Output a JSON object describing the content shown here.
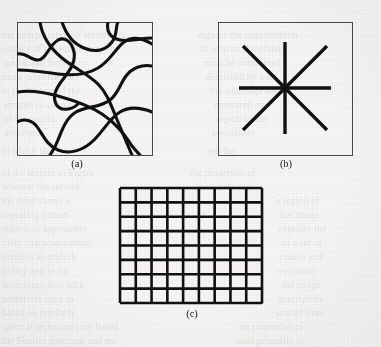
{
  "figure": {
    "background_color": "#f5f4f2",
    "ink_color": "#111111",
    "frame_color": "#4a4a4a",
    "panels": [
      {
        "id": "a",
        "caption": "(a)",
        "kind": "random-curves",
        "description": "Irregular meandering thick curves forming a cellular tessellation — random texture",
        "frame": {
          "x": 17,
          "y": 22,
          "width": 135,
          "height": 133
        },
        "stroke_width": 3.1,
        "curve_count": 7,
        "curves": [
          "M 17,54 C 26,52 30,60 38,60 C 46,60 49,45 58,40 C 66,36 72,43 74,52 C 76,62 70,70 64,78 C 56,88 52,96 56,104 C 60,112 72,110 78,104",
          "M 62,22 C 66,34 74,44 84,48 C 96,53 106,50 112,42 C 118,34 115,27 118,22",
          "M 17,92 C 30,90 44,92 58,96 C 76,101 90,106 102,114 C 116,123 124,134 132,146 C 136,151 138,153 140,155",
          "M 108,22 C 106,31 110,38 120,40 C 130,42 140,38 152,38",
          "M 17,122 C 24,118 33,120 38,128 C 44,137 48,146 58,150 C 70,155 84,150 94,140 C 104,130 110,118 120,112 C 130,106 142,108 152,112",
          "M 40,22 C 42,36 50,48 62,58 C 74,68 88,74 98,84 C 108,94 112,108 118,122 C 123,134 128,146 132,155",
          "M 152,66 C 142,64 132,68 126,76 C 120,84 118,94 110,100 C 100,108 86,106 76,112 C 66,118 62,130 58,140 C 55,148 52,152 50,155",
          "M 17,70 C 30,70 44,72 58,74 C 74,76 88,74 98,68 C 110,61 116,48 124,42 C 132,36 142,38 152,44"
        ]
      },
      {
        "id": "b",
        "caption": "(b)",
        "kind": "oriented-starburst",
        "description": "Eight straight spokes radiating from a common center at 0, 45, 90 and 135 degrees — directional texture",
        "frame": {
          "x": 218,
          "y": 22,
          "width": 134,
          "height": 133
        },
        "stroke_width": 3.4,
        "center": {
          "x": 285,
          "y": 88
        },
        "spoke_count": 8,
        "spoke_angles_deg": [
          0,
          45,
          90,
          135,
          180,
          225,
          270,
          315
        ],
        "lines": [
          {
            "x1": 239,
            "y1": 88,
            "x2": 331,
            "y2": 88
          },
          {
            "x1": 285,
            "y1": 42,
            "x2": 285,
            "y2": 134
          },
          {
            "x1": 243,
            "y1": 46,
            "x2": 327,
            "y2": 130
          },
          {
            "x1": 327,
            "y1": 46,
            "x2": 243,
            "y2": 130
          }
        ]
      },
      {
        "id": "c",
        "caption": "(c)",
        "kind": "regular-grid",
        "description": "Regular square lattice of thick intersecting lines — periodic texture",
        "frame": {
          "x": 120,
          "y": 188,
          "width": 142,
          "height": 115
        },
        "stroke_width": 2.6,
        "columns": 9,
        "rows": 8,
        "cell_width": 15.78,
        "cell_height": 14.38
      }
    ],
    "bleed_text": [
      {
        "x": 2,
        "y": 30,
        "text": "the interpretation of textures in"
      },
      {
        "x": 198,
        "y": 30,
        "text": "regions the segmentation"
      },
      {
        "x": 2,
        "y": 44,
        "text": "surface of the image may be"
      },
      {
        "x": 200,
        "y": 44,
        "text": "of structural methods"
      },
      {
        "x": 2,
        "y": 58,
        "text": "spatial and frequency"
      },
      {
        "x": 204,
        "y": 58,
        "text": "must be considered"
      },
      {
        "x": 2,
        "y": 72,
        "text": "more properties are"
      },
      {
        "x": 206,
        "y": 72,
        "text": "described by a set"
      },
      {
        "x": 2,
        "y": 86,
        "text": "in the texture of the"
      },
      {
        "x": 210,
        "y": 86,
        "text": "the subimage and"
      },
      {
        "x": 4,
        "y": 100,
        "text": "smooth or coarse"
      },
      {
        "x": 214,
        "y": 100,
        "text": "measured over"
      },
      {
        "x": 4,
        "y": 114,
        "text": "of the region"
      },
      {
        "x": 216,
        "y": 114,
        "text": "region of the"
      },
      {
        "x": 4,
        "y": 128,
        "text": "descriptor"
      },
      {
        "x": 212,
        "y": 128,
        "text": "boundaries"
      },
      {
        "x": 2,
        "y": 146,
        "text": "in which the"
      },
      {
        "x": 206,
        "y": 146,
        "text": "and the"
      },
      {
        "x": 2,
        "y": 168,
        "text": "of the texture in Figure"
      },
      {
        "x": 190,
        "y": 168,
        "text": "the properties of"
      },
      {
        "x": 2,
        "y": 182,
        "text": "whereas the second"
      },
      {
        "x": 196,
        "y": 182,
        "text": "is smooth and"
      },
      {
        "x": 2,
        "y": 196,
        "text": "the third shows a"
      },
      {
        "x": 276,
        "y": 196,
        "text": "a region of"
      },
      {
        "x": 2,
        "y": 210,
        "text": "repeating pattern"
      },
      {
        "x": 280,
        "y": 210,
        "text": "the image"
      },
      {
        "x": 2,
        "y": 224,
        "text": "statistical approaches"
      },
      {
        "x": 278,
        "y": 224,
        "text": "consider the"
      },
      {
        "x": 2,
        "y": 238,
        "text": "yield characterizations"
      },
      {
        "x": 282,
        "y": 238,
        "text": "of a set of"
      },
      {
        "x": 2,
        "y": 252,
        "text": "textures as smooth"
      },
      {
        "x": 280,
        "y": 252,
        "text": "coarse and"
      },
      {
        "x": 2,
        "y": 266,
        "text": "grainy and so on"
      },
      {
        "x": 278,
        "y": 266,
        "text": "structural"
      },
      {
        "x": 2,
        "y": 280,
        "text": "techniques deal with"
      },
      {
        "x": 282,
        "y": 280,
        "text": "the image"
      },
      {
        "x": 2,
        "y": 294,
        "text": "primitives such as"
      },
      {
        "x": 278,
        "y": 294,
        "text": "description"
      },
      {
        "x": 2,
        "y": 308,
        "text": "based on regularly"
      },
      {
        "x": 276,
        "y": 308,
        "text": "spaced lines"
      },
      {
        "x": 2,
        "y": 322,
        "text": "spectral techniques are based"
      },
      {
        "x": 240,
        "y": 322,
        "text": "on properties of"
      },
      {
        "x": 2,
        "y": 336,
        "text": "the Fourier spectrum and are"
      },
      {
        "x": 236,
        "y": 336,
        "text": "used primarily to"
      }
    ]
  }
}
